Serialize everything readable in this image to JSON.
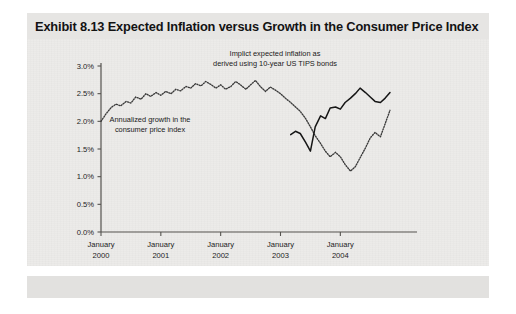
{
  "figure": {
    "title": "Exhibit 8.13 Expected Inflation versus Growth in the Consumer Price Index",
    "panel_color": "#ecebe9",
    "title_band_color": "#e6e5e3"
  },
  "annotations": {
    "tips_line1": "Implict expected inflation as",
    "tips_line2": "derived using 10-year US TIPS bonds",
    "cpi_line1": "Annualized growth in the",
    "cpi_line2": "consumer price index"
  },
  "chart_data": {
    "type": "line",
    "title": "Exhibit 8.13 Expected Inflation versus Growth in the Consumer Price Index",
    "xlabel": "",
    "ylabel": "",
    "ylim": [
      0.0,
      3.0
    ],
    "ytick_labels": [
      "0.0%",
      "0.5%",
      "1.0%",
      "1.5%",
      "2.0%",
      "2.5%",
      "3.0%"
    ],
    "ytick_values": [
      0.0,
      0.5,
      1.0,
      1.5,
      2.0,
      2.5,
      3.0
    ],
    "xtick_labels": [
      [
        "January",
        "2000"
      ],
      [
        "January",
        "2001"
      ],
      [
        "January",
        "2002"
      ],
      [
        "January",
        "2003"
      ],
      [
        "January",
        "2004"
      ]
    ],
    "xtick_values": [
      2000.0,
      2001.0,
      2002.0,
      2003.0,
      2004.0
    ],
    "xlim": [
      2000.0,
      2004.83
    ],
    "grid": false,
    "legend_position": "annotations-inline",
    "series": [
      {
        "name": "Annualized growth in the consumer price index",
        "style": "dotted",
        "color": "#3a3a3a",
        "x": [
          2000.0,
          2000.08,
          2000.17,
          2000.25,
          2000.33,
          2000.42,
          2000.5,
          2000.58,
          2000.67,
          2000.75,
          2000.83,
          2000.92,
          2001.0,
          2001.08,
          2001.17,
          2001.25,
          2001.33,
          2001.42,
          2001.5,
          2001.58,
          2001.67,
          2001.75,
          2001.83,
          2001.92,
          2002.0,
          2002.08,
          2002.17,
          2002.25,
          2002.33,
          2002.42,
          2002.5,
          2002.58,
          2002.67,
          2002.75,
          2002.83,
          2002.92,
          2003.0,
          2003.08,
          2003.17,
          2003.25,
          2003.33,
          2003.42,
          2003.5,
          2003.58,
          2003.67,
          2003.75,
          2003.83,
          2003.92,
          2004.0,
          2004.08,
          2004.17,
          2004.25,
          2004.33,
          2004.42,
          2004.5,
          2004.58,
          2004.67,
          2004.75,
          2004.83
        ],
        "values": [
          2.0,
          2.13,
          2.25,
          2.31,
          2.28,
          2.36,
          2.33,
          2.44,
          2.4,
          2.5,
          2.45,
          2.52,
          2.47,
          2.54,
          2.5,
          2.58,
          2.55,
          2.63,
          2.6,
          2.68,
          2.64,
          2.72,
          2.67,
          2.6,
          2.66,
          2.58,
          2.63,
          2.72,
          2.66,
          2.58,
          2.66,
          2.74,
          2.62,
          2.54,
          2.62,
          2.56,
          2.5,
          2.42,
          2.34,
          2.26,
          2.18,
          2.05,
          1.9,
          1.74,
          1.6,
          1.46,
          1.36,
          1.44,
          1.36,
          1.22,
          1.1,
          1.18,
          1.34,
          1.52,
          1.7,
          1.8,
          1.72,
          1.96,
          2.2
        ]
      },
      {
        "name": "Implict expected inflation derived using 10-year US TIPS bonds",
        "style": "solid",
        "color": "#161616",
        "x": [
          2003.17,
          2003.25,
          2003.33,
          2003.42,
          2003.5,
          2003.58,
          2003.67,
          2003.75,
          2003.83,
          2003.92,
          2004.0,
          2004.08,
          2004.17,
          2004.25,
          2004.33,
          2004.42,
          2004.5,
          2004.58,
          2004.67,
          2004.75,
          2004.83
        ],
        "values": [
          1.76,
          1.82,
          1.78,
          1.62,
          1.46,
          1.9,
          2.1,
          2.05,
          2.24,
          2.26,
          2.22,
          2.34,
          2.42,
          2.5,
          2.6,
          2.52,
          2.44,
          2.36,
          2.34,
          2.42,
          2.52
        ]
      }
    ]
  }
}
